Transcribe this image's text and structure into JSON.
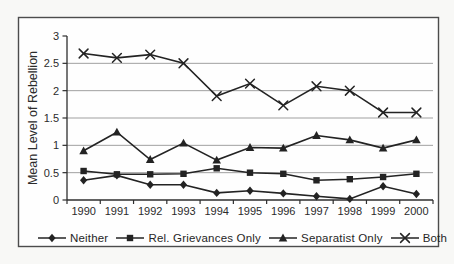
{
  "window": {
    "width_px": 454,
    "height_px": 264
  },
  "colors": {
    "page_background": "#f3f3f1",
    "figure_background": "#fefefe",
    "figure_border": "#4c4c4c",
    "gridline": "#a0a0a0",
    "axis": "#2e2e2e",
    "series_line": "#232323",
    "text": "#2b2b2b"
  },
  "chart_data": {
    "type": "line",
    "title": "",
    "xlabel": "",
    "ylabel": "Mean Level of Rebellion",
    "x": [
      1990,
      1991,
      1992,
      1993,
      1994,
      1995,
      1996,
      1997,
      1998,
      1999,
      2000
    ],
    "x_tick_labels": [
      "1990",
      "1991",
      "1992",
      "1993",
      "1994",
      "1995",
      "1996",
      "1997",
      "1998",
      "1999",
      "2000"
    ],
    "ylim": [
      0,
      3
    ],
    "yticks": [
      0,
      0.5,
      1,
      1.5,
      2,
      2.5,
      3
    ],
    "grid": "horizontal-only",
    "legend_position": "bottom",
    "series": [
      {
        "name": "Neither",
        "marker": "diamond",
        "values": [
          0.36,
          0.45,
          0.28,
          0.28,
          0.13,
          0.17,
          0.12,
          0.07,
          0.02,
          0.25,
          0.11
        ]
      },
      {
        "name": "Rel. Grievances Only",
        "marker": "square",
        "values": [
          0.53,
          0.47,
          0.47,
          0.48,
          0.58,
          0.5,
          0.48,
          0.36,
          0.38,
          0.42,
          0.48
        ]
      },
      {
        "name": "Separatist Only",
        "marker": "triangle",
        "values": [
          0.9,
          1.24,
          0.74,
          1.04,
          0.73,
          0.96,
          0.95,
          1.18,
          1.1,
          0.95,
          1.1
        ]
      },
      {
        "name": "Both",
        "marker": "x",
        "values": [
          2.68,
          2.6,
          2.66,
          2.5,
          1.9,
          2.13,
          1.73,
          2.08,
          2.0,
          1.6,
          1.6
        ]
      }
    ]
  }
}
